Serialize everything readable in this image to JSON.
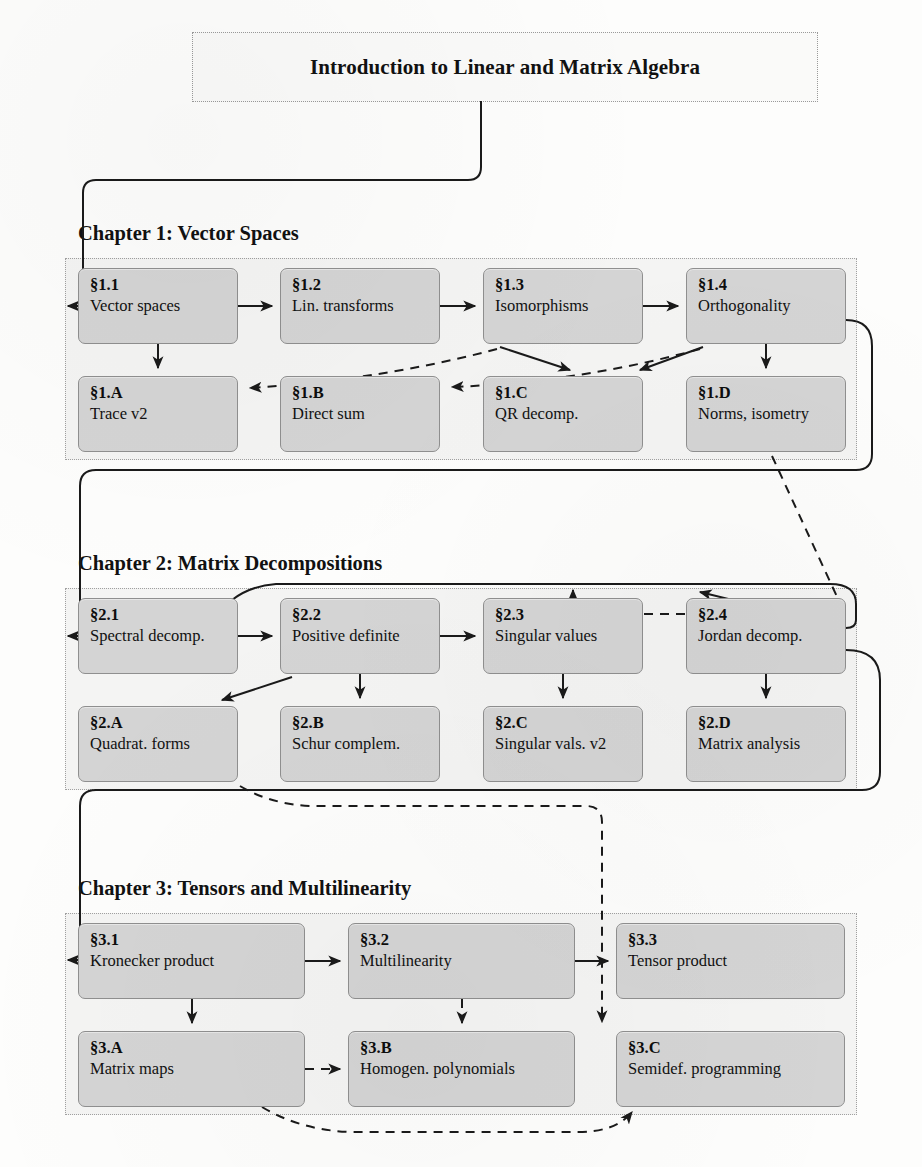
{
  "title": {
    "text": "Introduction to Linear and Matrix Algebra"
  },
  "chapters": [
    {
      "heading": "Chapter 1:  Vector Spaces",
      "panel": {
        "x": 65,
        "y": 258,
        "w": 790,
        "h": 200
      },
      "heading_pos": {
        "x": 78,
        "y": 222
      },
      "nodes": [
        {
          "id": "1.1",
          "num": "§1.1",
          "desc": "Vector spaces",
          "x": 78,
          "y": 268,
          "w": 160,
          "h": 76
        },
        {
          "id": "1.2",
          "num": "§1.2",
          "desc": "Lin. transforms",
          "x": 280,
          "y": 268,
          "w": 160,
          "h": 76
        },
        {
          "id": "1.3",
          "num": "§1.3",
          "desc": "Isomorphisms",
          "x": 483,
          "y": 268,
          "w": 160,
          "h": 76
        },
        {
          "id": "1.4",
          "num": "§1.4",
          "desc": "Orthogonality",
          "x": 686,
          "y": 268,
          "w": 160,
          "h": 76
        },
        {
          "id": "1.A",
          "num": "§1.A",
          "desc": "Trace v2",
          "x": 78,
          "y": 376,
          "w": 160,
          "h": 76
        },
        {
          "id": "1.B",
          "num": "§1.B",
          "desc": "Direct sum",
          "x": 280,
          "y": 376,
          "w": 160,
          "h": 76
        },
        {
          "id": "1.C",
          "num": "§1.C",
          "desc": "QR decomp.",
          "x": 483,
          "y": 376,
          "w": 160,
          "h": 76
        },
        {
          "id": "1.D",
          "num": "§1.D",
          "desc": "Norms, isometry",
          "x": 686,
          "y": 376,
          "w": 160,
          "h": 76
        }
      ]
    },
    {
      "heading": "Chapter 2:  Matrix Decompositions",
      "panel": {
        "x": 65,
        "y": 588,
        "w": 790,
        "h": 200
      },
      "heading_pos": {
        "x": 78,
        "y": 552
      },
      "nodes": [
        {
          "id": "2.1",
          "num": "§2.1",
          "desc": "Spectral decomp.",
          "x": 78,
          "y": 598,
          "w": 160,
          "h": 76
        },
        {
          "id": "2.2",
          "num": "§2.2",
          "desc": "Positive definite",
          "x": 280,
          "y": 598,
          "w": 160,
          "h": 76
        },
        {
          "id": "2.3",
          "num": "§2.3",
          "desc": "Singular values",
          "x": 483,
          "y": 598,
          "w": 160,
          "h": 76
        },
        {
          "id": "2.4",
          "num": "§2.4",
          "desc": "Jordan decomp.",
          "x": 686,
          "y": 598,
          "w": 160,
          "h": 76
        },
        {
          "id": "2.A",
          "num": "§2.A",
          "desc": "Quadrat. forms",
          "x": 78,
          "y": 706,
          "w": 160,
          "h": 76
        },
        {
          "id": "2.B",
          "num": "§2.B",
          "desc": "Schur complem.",
          "x": 280,
          "y": 706,
          "w": 160,
          "h": 76
        },
        {
          "id": "2.C",
          "num": "§2.C",
          "desc": "Singular vals. v2",
          "x": 483,
          "y": 706,
          "w": 160,
          "h": 76
        },
        {
          "id": "2.D",
          "num": "§2.D",
          "desc": "Matrix analysis",
          "x": 686,
          "y": 706,
          "w": 160,
          "h": 76
        }
      ]
    },
    {
      "heading": "Chapter 3:  Tensors and Multilinearity",
      "panel": {
        "x": 65,
        "y": 913,
        "w": 790,
        "h": 200
      },
      "heading_pos": {
        "x": 78,
        "y": 877
      },
      "nodes": [
        {
          "id": "3.1",
          "num": "§3.1",
          "desc": "Kronecker product",
          "x": 78,
          "y": 923,
          "w": 227,
          "h": 76
        },
        {
          "id": "3.2",
          "num": "§3.2",
          "desc": "Multilinearity",
          "x": 348,
          "y": 923,
          "w": 227,
          "h": 76
        },
        {
          "id": "3.3",
          "num": "§3.3",
          "desc": "Tensor product",
          "x": 616,
          "y": 923,
          "w": 229,
          "h": 76
        },
        {
          "id": "3.A",
          "num": "§3.A",
          "desc": "Matrix maps",
          "x": 78,
          "y": 1031,
          "w": 227,
          "h": 76
        },
        {
          "id": "3.B",
          "num": "§3.B",
          "desc": "Homogen. polynomials",
          "x": 348,
          "y": 1031,
          "w": 227,
          "h": 76
        },
        {
          "id": "3.C",
          "num": "§3.C",
          "desc": "Semidef. programming",
          "x": 616,
          "y": 1031,
          "w": 229,
          "h": 76
        }
      ]
    }
  ],
  "edges": [
    {
      "name": "title-to-1-1",
      "style": "solid",
      "d": "M 481 101 L 481 167 Q 481 180 468 180 L 96 180 Q 83 180 83 193 L 83 293 Q 83 306 96 306 L 68 306"
    },
    {
      "name": "1-1-to-1-2",
      "style": "solid",
      "d": "M 238 306 L 272 306"
    },
    {
      "name": "1-2-to-1-3",
      "style": "solid",
      "d": "M 440 306 L 475 306"
    },
    {
      "name": "1-3-to-1-4",
      "style": "solid",
      "d": "M 643 306 L 678 306"
    },
    {
      "name": "1-1-to-1-A",
      "style": "solid",
      "d": "M 158 344 L 158 368"
    },
    {
      "name": "1-3-to-1-A",
      "style": "dashed",
      "d": "M 497 349 Q 380 380 250 388"
    },
    {
      "name": "1-3-to-1-C",
      "style": "solid",
      "d": "M 500 347 L 570 370"
    },
    {
      "name": "1-4-to-1-B",
      "style": "dashed",
      "d": "M 700 349 Q 580 382 452 387"
    },
    {
      "name": "1-4-to-1-C",
      "style": "solid",
      "d": "M 703 347 L 640 370"
    },
    {
      "name": "1-4-to-1-D",
      "style": "solid",
      "d": "M 766 344 L 766 368"
    },
    {
      "name": "1-4-to-2-1",
      "style": "solid",
      "d": "M 846 320 Q 872 320 872 346 L 872 454 Q 872 470 856 470 L 96 470 Q 80 470 80 486 L 80 620 Q 80 636 96 636 L 68 636"
    },
    {
      "name": "1-D-to-2-3",
      "style": "dashed",
      "d": "M 772 456 L 845 614 M 845 614 L 573 614 L 573 590"
    },
    {
      "name": "2-1-to-2-2",
      "style": "solid",
      "d": "M 238 636 L 272 636"
    },
    {
      "name": "2-2-to-2-3",
      "style": "solid",
      "d": "M 440 636 L 475 636"
    },
    {
      "name": "2-1-to-2-4",
      "style": "solid",
      "d": "M 232 600 Q 250 586 276 584 L 830 584 Q 856 584 856 604 L 856 620 Q 856 628 846 628 L 700 592"
    },
    {
      "name": "2-2-to-2-A",
      "style": "solid",
      "d": "M 292 677 L 222 700"
    },
    {
      "name": "2-2-to-2-B",
      "style": "solid",
      "d": "M 360 674 L 360 698"
    },
    {
      "name": "2-3-to-2-C",
      "style": "solid",
      "d": "M 563 674 L 563 698"
    },
    {
      "name": "2-4-to-2-D",
      "style": "solid",
      "d": "M 766 674 L 766 698"
    },
    {
      "name": "2-4-to-3-1",
      "style": "solid",
      "d": "M 846 650 Q 880 650 880 680 L 880 772 Q 880 790 862 790 L 96 790 Q 80 790 80 806 L 80 944 Q 80 960 96 960 L 68 960"
    },
    {
      "name": "2-A-to-3-B",
      "style": "dashed",
      "d": "M 240 786 Q 270 804 310 806 L 586 806 Q 602 806 602 822 L 602 1010 L 602 1022"
    },
    {
      "name": "3-1-to-3-2",
      "style": "solid",
      "d": "M 305 961 L 340 961"
    },
    {
      "name": "3-2-to-3-3",
      "style": "solid",
      "d": "M 575 961 L 608 961"
    },
    {
      "name": "3-1-to-3-A",
      "style": "solid",
      "d": "M 192 999 L 192 1023"
    },
    {
      "name": "3-2-to-3-B",
      "style": "dashed",
      "d": "M 462 999 L 462 1023"
    },
    {
      "name": "3-A-to-3-B",
      "style": "dashed",
      "d": "M 305 1069 L 340 1069"
    },
    {
      "name": "3-A-to-3-C",
      "style": "dashed",
      "d": "M 262 1107 Q 300 1130 350 1132 L 578 1132 Q 616 1132 632 1112"
    }
  ],
  "colors": {
    "node_fill": "#d4d4d4",
    "node_border": "#8f8f8f",
    "panel_fill": "#f4f4f3",
    "panel_border": "#a0a0a0",
    "edge": "#1a1a1a",
    "page_bg": "#fdfdfc"
  }
}
